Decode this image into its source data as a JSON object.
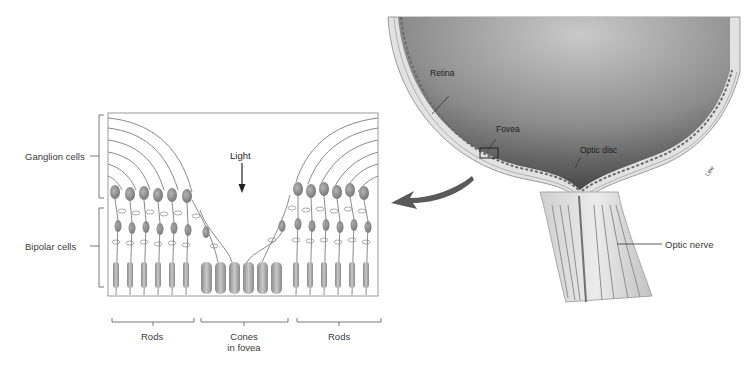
{
  "figure": {
    "type": "anatomical-diagram",
    "panels": [
      {
        "id": "retina-detail",
        "description": "Layered cell structure of the retina"
      },
      {
        "id": "eye-section",
        "description": "Rear of eyeball with optic nerve"
      }
    ]
  },
  "retina_detail": {
    "side_labels": {
      "ganglion": "Ganglion cells",
      "bipolar": "Bipolar cells"
    },
    "light_label": "Light",
    "bottom_labels": {
      "rods_left": "Rods",
      "cones_line1": "Cones",
      "cones_line2": "in fovea",
      "rods_right": "Rods"
    }
  },
  "eye_section": {
    "labels": {
      "retina": "Retina",
      "fovea": "Fovea",
      "optic_disc": "Optic disc",
      "optic_nerve": "Optic nerve",
      "artist_signature": "Lew"
    }
  },
  "colors": {
    "background": "#ffffff",
    "line": "#8a8a8a",
    "text": "#3a3a3a",
    "cell_fill": "#9a9a9a",
    "eye_interior": "#6a6a6a",
    "tissue": "#d8d8d8",
    "arrow": "#555555"
  }
}
